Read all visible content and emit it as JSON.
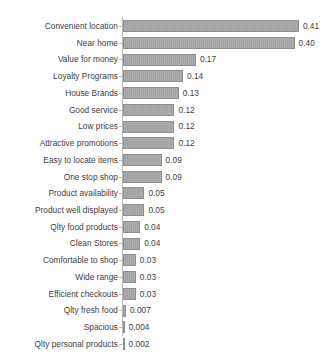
{
  "chart": {
    "type": "bar",
    "orientation": "horizontal",
    "background_color": "#ffffff",
    "bar_color": "#a3a3a3",
    "bar_border_color": "#8f8f8f",
    "text_color": "#3d3d3d",
    "axis_color": "#b9b9b9"
  },
  "chart_data": {
    "type": "bar",
    "title": "",
    "subtitle": "",
    "xlabel": "",
    "ylabel": "",
    "orientation": "horizontal",
    "grid": false,
    "legend": false,
    "xlim": [
      0,
      0.44
    ],
    "value_labels_shown": true,
    "categories": [
      "Convenient location",
      "Near home",
      "Value for money",
      "Loyalty Programs",
      "House Brands",
      "Good service",
      "Low prices",
      "Attractive promotions",
      "Easy to locate items",
      "One stop shop",
      "Product availability",
      "Product well displayed",
      "Qlty food products",
      "Clean Stores",
      "Comfortable to shop",
      "Wide range",
      "Efficient checkouts",
      "Qlty fresh food",
      "Spacious",
      "Qlty personal products"
    ],
    "values": [
      0.41,
      0.4,
      0.17,
      0.14,
      0.13,
      0.12,
      0.12,
      0.12,
      0.09,
      0.09,
      0.05,
      0.05,
      0.04,
      0.04,
      0.03,
      0.03,
      0.03,
      0.007,
      0.004,
      0.002
    ],
    "value_label_text": [
      "0.41",
      "0.40",
      "0.17",
      "0.14",
      "0.13",
      "0.12",
      "0.12",
      "0.12",
      "0.09",
      "0.09",
      "0.05",
      "0.05",
      "0.04",
      "0.04",
      "0.03",
      "0.03",
      "0.03",
      "0.007",
      "0.004",
      "0.002"
    ]
  }
}
